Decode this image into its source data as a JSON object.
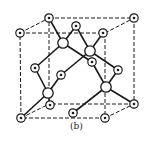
{
  "figure": {
    "caption": "(b)",
    "line_color": "#1a1a1a",
    "cube_edges_dashed": [
      [
        [
          49,
          18
        ],
        [
          134,
          18
        ]
      ],
      [
        [
          134,
          18
        ],
        [
          134,
          104
        ]
      ],
      [
        [
          134,
          104
        ],
        [
          49,
          104
        ]
      ],
      [
        [
          49,
          104
        ],
        [
          49,
          18
        ]
      ],
      [
        [
          20,
          33
        ],
        [
          105,
          33
        ]
      ],
      [
        [
          105,
          33
        ],
        [
          105,
          118
        ]
      ],
      [
        [
          105,
          118
        ],
        [
          21,
          118
        ]
      ],
      [
        [
          21,
          118
        ],
        [
          20,
          33
        ]
      ],
      [
        [
          20,
          33
        ],
        [
          49,
          18
        ]
      ],
      [
        [
          105,
          33
        ],
        [
          134,
          18
        ]
      ],
      [
        [
          105,
          118
        ],
        [
          134,
          104
        ]
      ],
      [
        [
          21,
          118
        ],
        [
          49,
          104
        ]
      ]
    ],
    "bonds": [
      [
        [
          49,
          18
        ],
        [
          63,
          43
        ]
      ],
      [
        [
          76,
          26
        ],
        [
          63,
          43
        ]
      ],
      [
        [
          63,
          43
        ],
        [
          35,
          68
        ]
      ],
      [
        [
          63,
          43
        ],
        [
          92,
          62
        ]
      ],
      [
        [
          103,
          33
        ],
        [
          90,
          51
        ]
      ],
      [
        [
          76,
          26
        ],
        [
          90,
          51
        ]
      ],
      [
        [
          90,
          51
        ],
        [
          61,
          75
        ]
      ],
      [
        [
          90,
          51
        ],
        [
          118,
          70
        ]
      ],
      [
        [
          35,
          68
        ],
        [
          48,
          93
        ]
      ],
      [
        [
          61,
          75
        ],
        [
          48,
          93
        ]
      ],
      [
        [
          48,
          93
        ],
        [
          21,
          118
        ]
      ],
      [
        [
          48,
          93
        ],
        [
          50,
          105
        ]
      ],
      [
        [
          92,
          62
        ],
        [
          106,
          87
        ]
      ],
      [
        [
          118,
          70
        ],
        [
          106,
          87
        ]
      ],
      [
        [
          106,
          87
        ],
        [
          73,
          113
        ]
      ],
      [
        [
          106,
          87
        ],
        [
          134,
          104
        ]
      ]
    ],
    "atoms_fcc": [
      [
        49,
        18
      ],
      [
        134,
        18
      ],
      [
        20,
        33
      ],
      [
        76,
        26
      ],
      [
        103,
        33
      ],
      [
        92,
        62
      ],
      [
        35,
        68
      ],
      [
        61,
        75
      ],
      [
        118,
        70
      ],
      [
        50,
        105
      ],
      [
        134,
        104
      ],
      [
        21,
        118
      ],
      [
        73,
        113
      ],
      [
        105,
        118
      ]
    ],
    "atoms_interior": [
      [
        63,
        43
      ],
      [
        90,
        51
      ],
      [
        48,
        93
      ],
      [
        106,
        87
      ]
    ]
  }
}
